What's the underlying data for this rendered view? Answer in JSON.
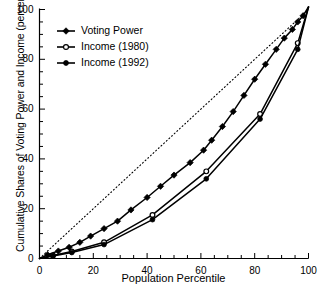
{
  "chart_data": {
    "type": "line",
    "title": "",
    "xlabel": "Population Percentile",
    "ylabel": "Cumulative Shares of Voting Power and Income (percentage)",
    "xlim": [
      0,
      100
    ],
    "ylim": [
      0,
      100
    ],
    "xticks": [
      "0",
      "20",
      "40",
      "60",
      "80",
      "100"
    ],
    "xtick_values": [
      0,
      20,
      40,
      60,
      80,
      100
    ],
    "yticks": [
      "0",
      "20",
      "40",
      "60",
      "80",
      "100"
    ],
    "ytick_values": [
      0,
      20,
      40,
      60,
      80,
      100
    ],
    "minor_tick_step": 5,
    "grid": false,
    "legend_position": "upper-left-inside",
    "reference_line": {
      "name": "line-of-equality",
      "style": "dotted",
      "x": [
        0,
        100
      ],
      "y": [
        0,
        100
      ]
    },
    "series": [
      {
        "name": "Voting Power",
        "marker": "diamond-filled",
        "x": [
          0,
          3,
          7,
          11,
          15,
          19,
          24,
          29,
          34,
          40,
          45,
          50,
          56,
          61,
          64,
          68,
          72,
          76,
          80,
          84,
          88,
          91,
          94,
          96,
          98,
          100
        ],
        "values": [
          0,
          1.5,
          3,
          4.5,
          6.5,
          9,
          12,
          15,
          19.5,
          24.5,
          29,
          33.5,
          38.5,
          43.5,
          47.5,
          53,
          59,
          65.5,
          72,
          78,
          84,
          88.5,
          92,
          95,
          97.5,
          101
        ]
      },
      {
        "name": "Income (1980)",
        "marker": "circle-open",
        "x": [
          0,
          5,
          12,
          24,
          42,
          62,
          82,
          96,
          100
        ],
        "values": [
          0,
          1.2,
          2.8,
          6.5,
          17.5,
          35,
          58,
          86.5,
          101
        ]
      },
      {
        "name": "Income (1992)",
        "marker": "circle-filled",
        "x": [
          0,
          5,
          12,
          24,
          42,
          62,
          82,
          96,
          100
        ],
        "values": [
          0,
          1.0,
          2.4,
          5.6,
          15.6,
          32,
          56,
          84,
          101
        ]
      }
    ]
  },
  "legend": {
    "items": [
      {
        "label": "Voting Power",
        "marker": "diamond-filled"
      },
      {
        "label": "Income (1980)",
        "marker": "circle-open"
      },
      {
        "label": "Income (1992)",
        "marker": "circle-filled"
      }
    ]
  },
  "axes": {
    "x_title": "Population Percentile",
    "y_title": "Cumulative Shares of Voting Power and Income (percentage)"
  },
  "colors": {
    "ink": "#000000",
    "background": "#ffffff"
  }
}
